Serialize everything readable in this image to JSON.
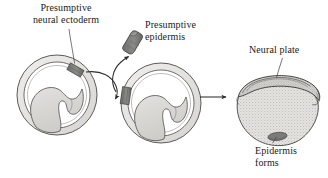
{
  "figure": {
    "background_color": "#ffffff",
    "text_color": "#1a1a18"
  },
  "labels": {
    "neural_ectoderm": "Presumptive\nneural ectoderm",
    "epidermis": "Presumptive\nepidermis",
    "neural_plate": "Neural plate",
    "epidermis_forms": "Epidermis\nforms"
  },
  "colors": {
    "outline": "#4a4a48",
    "outline_dark": "#2f2f2e",
    "ectoderm_ring": "#e6e5e3",
    "ectoderm_ring_shade": "#d2d1ce",
    "inner_mass": "#d4d3d0",
    "inner_mass_light": "#e9e8e6",
    "graft_dark": "#7d7d7a",
    "graft_dark_edge": "#5b5b58",
    "neurula_body": "#dedcd8",
    "neurula_stipple": "#8e8c88",
    "arrow": "#2b2b2a",
    "leader": "#4a4a48"
  },
  "stages": [
    {
      "name": "donor-gastrula",
      "description": "Gastrula embryo in cross section with presumptive neural ectoderm graft region marked dark at dorsal-right position",
      "graft_position": "upper-right"
    },
    {
      "name": "explanted-tissue",
      "description": "Isolated block of presumptive epidermis tissue removed from embryo",
      "graft_position": "isolated"
    },
    {
      "name": "host-gastrula",
      "description": "Gastrula embryo in cross section with transplanted tissue grafted at left ventral position",
      "graft_position": "left"
    },
    {
      "name": "neurula",
      "description": "Resulting neurula embryo with neural plate forming dorsally and epidermis forming at graft site ventrally",
      "graft_position": "ventral"
    }
  ],
  "arrows": [
    {
      "name": "donor-to-host",
      "type": "curved",
      "from": "donor-gastrula",
      "to": "host-gastrula"
    },
    {
      "name": "donor-to-explant",
      "type": "curved",
      "from": "donor-gastrula",
      "to": "explanted-tissue"
    },
    {
      "name": "host-to-neurula",
      "type": "straight",
      "from": "host-gastrula",
      "to": "neurula"
    }
  ]
}
